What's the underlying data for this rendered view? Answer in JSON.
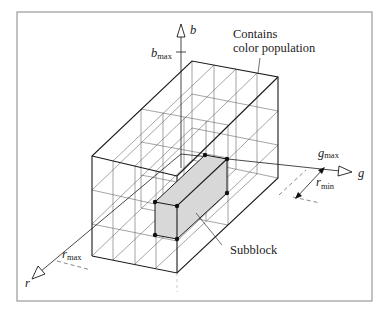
{
  "figure": {
    "frame": {
      "x": 17,
      "y": 12,
      "w": 355,
      "h": 289
    },
    "labels": {
      "b_axis": "b",
      "b_max": "b",
      "b_max_sub": "max",
      "g_axis": "g",
      "g_max": "g",
      "g_max_sub": "max",
      "r_axis": "r",
      "r_max": "r",
      "r_max_sub": "max",
      "r_min": "r",
      "r_min_sub": "min",
      "contains_line1": "Contains",
      "contains_line2": "color population",
      "subblock": "Subblock"
    },
    "colors": {
      "subblock_fill": "#d8d8d8",
      "frame_stroke": "#9a9a9a",
      "line": "#1a1a1a"
    },
    "box": {
      "front_top_left": [
        92,
        156
      ],
      "front_top_right": [
        177,
        176
      ],
      "front_bottom_left": [
        92,
        256
      ],
      "front_bottom_right": [
        177,
        273
      ],
      "back_top_left": [
        192,
        61
      ],
      "back_top_right": [
        278,
        77
      ],
      "back_bottom_right": [
        278,
        178
      ],
      "grid_divisions": {
        "g": 4,
        "b": 3,
        "r": 2
      }
    },
    "subblock_vertices": [
      [
        205,
        155
      ],
      [
        227,
        159
      ],
      [
        227,
        193
      ],
      [
        155,
        202
      ],
      [
        177,
        206
      ],
      [
        155,
        235
      ],
      [
        177,
        239
      ]
    ]
  }
}
